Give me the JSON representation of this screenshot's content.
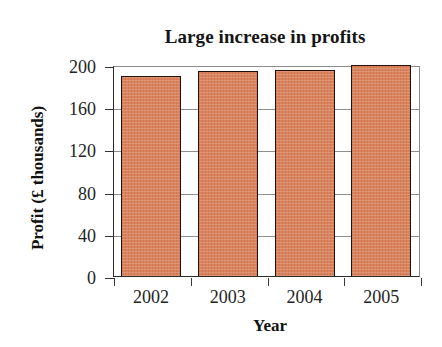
{
  "chart_data": {
    "type": "bar",
    "title": "Large increase in profits",
    "xlabel": "Year",
    "ylabel": "Profit (£ thousands)",
    "categories": [
      "2002",
      "2003",
      "2004",
      "2005"
    ],
    "values": [
      190,
      194,
      195,
      200
    ],
    "ylim": [
      0,
      200
    ],
    "yticks": [
      0,
      40,
      80,
      120,
      160,
      200
    ],
    "ytick_labels": [
      "0",
      "40",
      "80",
      "120",
      "160",
      "200"
    ],
    "grid": "horizontal",
    "legend": "none",
    "bar_color": "#d9825c",
    "bar_edge_color": "#241008",
    "axis_color": "#2b2b2b",
    "grid_color": "#8f8f8f",
    "background": "#ffffff"
  }
}
